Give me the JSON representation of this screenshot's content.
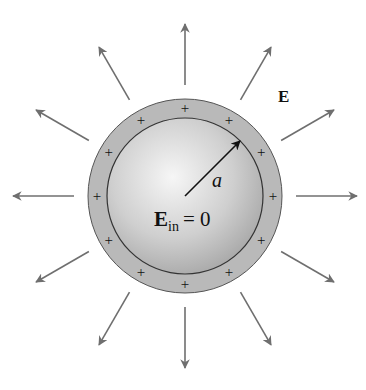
{
  "diagram": {
    "center": [
      185,
      196
    ],
    "outer_radius": 97,
    "inner_radius": 78,
    "charge_ring_radius": 88,
    "charge_count": 12,
    "charge_symbol": "+",
    "field_arrow_count": 12,
    "field_arrow_start_radius": 111,
    "field_arrow_end_radius": 172,
    "colors": {
      "shell_fill": "#b9b9b9",
      "sphere_center": "#f4f4f4",
      "sphere_edge": "#a8a8a8",
      "outline": "#333333",
      "field_arrow": "#6f6f6f",
      "radius_arrow": "#111111"
    }
  },
  "labels": {
    "field": "E",
    "radius": "a",
    "inner_field_symbol": "E",
    "inner_field_subscript": "in",
    "inner_field_value": "= 0"
  }
}
